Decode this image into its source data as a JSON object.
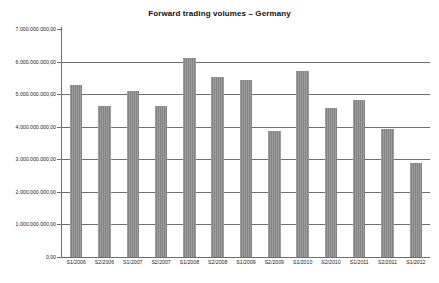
{
  "chart_data": {
    "type": "bar",
    "title": "Forward trading volumes – Germany",
    "xlabel": "",
    "ylabel": "",
    "categories": [
      "S1/2006",
      "S2/2006",
      "S1/2007",
      "S2/2007",
      "S1/2008",
      "S2/2008",
      "S1/2009",
      "S2/2009",
      "S1/2010",
      "S2/2010",
      "S1/2011",
      "S2/2011",
      "S1/2012"
    ],
    "values": [
      5280000000,
      4630000000,
      5100000000,
      4630000000,
      6120000000,
      5540000000,
      5420000000,
      3870000000,
      5720000000,
      4570000000,
      4830000000,
      3930000000,
      2890000000
    ],
    "ylim": [
      0,
      7000000000
    ],
    "ytick_values": [
      0,
      1000000000,
      2000000000,
      3000000000,
      4000000000,
      5000000000,
      6000000000,
      7000000000
    ],
    "ytick_labels": [
      "0,00",
      "1.000.000.000,00",
      "2.000.000.000,00",
      "3.000.000.000,00",
      "4.000.000.000,00",
      "5.000.000.000,00",
      "6.000.000.000,00",
      "7.000.000.000,00"
    ],
    "gridline_values": [
      1000000000,
      2000000000,
      3000000000,
      4000000000,
      5000000000,
      6000000000
    ],
    "grid": true,
    "legend": false,
    "legend_position": "none",
    "bar_color": "#8a8a8a",
    "axis_color": "#6f6f6f",
    "background_color": "#ffffff"
  }
}
